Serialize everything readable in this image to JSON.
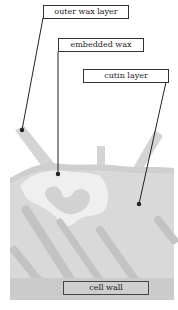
{
  "diagram": {
    "labels": {
      "outer_wax": "outer wax layer",
      "embedded_wax": "embedded wax",
      "cutin": "cutin layer",
      "cell_wall": "cell wall"
    },
    "colors": {
      "background": "#ffffff",
      "outer_wax": "#d6d6d6",
      "embedded_wax": "#eeeeee",
      "cutin": "#d9d9d9",
      "cell_wall": "#cccccc",
      "strands": "#c2c2c2",
      "leader": "#222222"
    }
  }
}
